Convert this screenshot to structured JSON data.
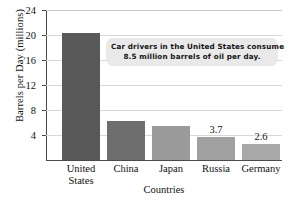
{
  "chart_data": {
    "type": "bar",
    "title": "",
    "xlabel": "Countries",
    "ylabel": "Barrels per Day (millions)",
    "categories": [
      "United States",
      "China",
      "Japan",
      "Russia",
      "Germany"
    ],
    "values": [
      20.4,
      6.3,
      5.4,
      3.7,
      2.6
    ],
    "value_labels": [
      "",
      "",
      "",
      "3.7",
      "2.6"
    ],
    "bar_colors": [
      "#595959",
      "#6e6e6e",
      "#9a9a9a",
      "#a0a0a0",
      "#a8a8a8"
    ],
    "ylim": [
      0,
      24
    ],
    "yticks": [
      4,
      8,
      12,
      16,
      20,
      24
    ],
    "ytick_labels": [
      "4",
      "8",
      "12",
      "16",
      "20",
      "24"
    ],
    "grid": true,
    "legend": "none",
    "annotations": [
      {
        "name": "callout",
        "line1": "Car drivers in the United States consume",
        "line2": "8.5 million barrels of oil per day."
      }
    ]
  }
}
